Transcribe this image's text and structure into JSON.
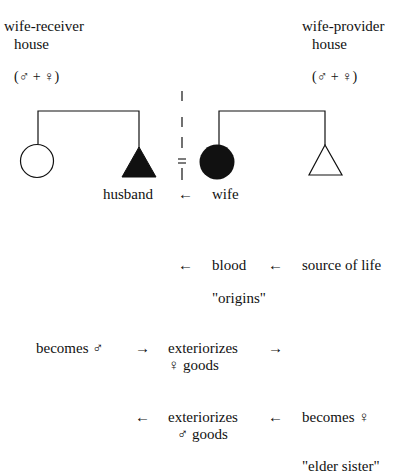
{
  "left_house": {
    "title_line1": "wife-receiver",
    "title_line2": "house",
    "members": "(♂ + ♀)"
  },
  "right_house": {
    "title_line1": "wife-provider",
    "title_line2": "house",
    "members": "(♂ + ♀)"
  },
  "kinship": {
    "husband_label": "husband",
    "wife_label": "wife",
    "marriage_arrow": "←",
    "marriage_symbol": "="
  },
  "flow": {
    "row1": {
      "arrow1": "←",
      "middle": "blood",
      "arrow2": "←",
      "right": "source of life"
    },
    "row1_note": "\"origins\"",
    "row2": {
      "left": "becomes ♂",
      "arrow1": "→",
      "middle_line1": "exteriorizes",
      "middle_line2": "♀ goods",
      "arrow2": "→"
    },
    "row3": {
      "arrow1": "←",
      "middle_line1": "exteriorizes",
      "middle_line2": "♂ goods",
      "arrow2": "←",
      "right": "becomes ♀"
    },
    "row3_note": "\"elder sister\""
  }
}
